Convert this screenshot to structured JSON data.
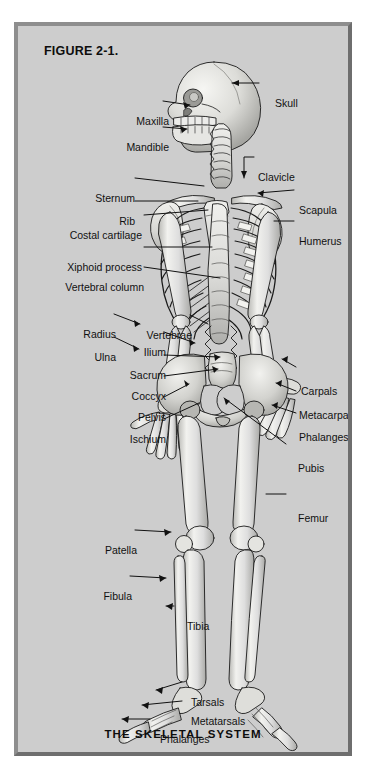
{
  "figure": {
    "number_label": "FIGURE 2-1.",
    "caption": "THE SKELETAL SYSTEM",
    "frame_color": "#7e7e7e",
    "background_color": "#cdcdcd",
    "page_background": "#ffffff",
    "bone_fill_color": "#e8e8e6",
    "outline_color": "#1a1a1a",
    "leader_line_color": "#111111"
  },
  "labels": {
    "left": [
      {
        "text": "Maxilla",
        "x": 151,
        "y": 96,
        "target_x": 186,
        "target_y": 100
      },
      {
        "text": "Mandible",
        "x": 151,
        "y": 122,
        "target_x": 183,
        "target_y": 124
      },
      {
        "text": "Sternum",
        "x": 114,
        "y": 173,
        "target_x": 193,
        "target_y": 180
      },
      {
        "text": "Rib",
        "x": 114,
        "y": 196,
        "target_x": 186,
        "target_y": 196
      },
      {
        "text": "Costal cartilage",
        "x": 137,
        "y": 216,
        "target_x": 196,
        "target_y": 210
      },
      {
        "text": "Xiphoid process",
        "x": 137,
        "y": 242,
        "target_x": 199,
        "target_y": 242
      },
      {
        "text": "Vertebral column",
        "x": 137,
        "y": 262,
        "target_x": 207,
        "target_y": 272
      },
      {
        "text": "Radius",
        "x": 104,
        "y": 309,
        "target_x": 127,
        "target_y": 318
      },
      {
        "text": "Ulna",
        "x": 104,
        "y": 332,
        "target_x": 126,
        "target_y": 343
      },
      {
        "text": "Vertebrae",
        "x": 181,
        "y": 310,
        "target_x": 196,
        "target_y": 318
      },
      {
        "text": "Ilium",
        "x": 155,
        "y": 327,
        "target_x": 182,
        "target_y": 337
      },
      {
        "text": "Sacrum",
        "x": 155,
        "y": 350,
        "target_x": 207,
        "target_y": 351
      },
      {
        "text": "Coccyx",
        "x": 155,
        "y": 371,
        "target_x": 205,
        "target_y": 363
      },
      {
        "text": "Pelvis",
        "x": 155,
        "y": 392,
        "target_x": 176,
        "target_y": 378
      },
      {
        "text": "Ischium",
        "x": 155,
        "y": 414,
        "target_x": 186,
        "target_y": 397
      },
      {
        "text": "Patella",
        "x": 123,
        "y": 525,
        "target_x": 158,
        "target_y": 527
      },
      {
        "text": "Fibula",
        "x": 118,
        "y": 571,
        "target_x": 152,
        "target_y": 572
      },
      {
        "text": "Tibia",
        "x": 167,
        "y": 601,
        "target_x": 153,
        "target_y": 600
      }
    ],
    "right": [
      {
        "text": "Skull",
        "x": 255,
        "y": 78,
        "target_x": 228,
        "target_y": 79
      },
      {
        "text": "Clavicle",
        "x": 238,
        "y": 152,
        "target_x": 232,
        "target_y": 173
      },
      {
        "text": "Scapula",
        "x": 290,
        "y": 185,
        "target_x": 243,
        "target_y": 187
      },
      {
        "text": "Humerus",
        "x": 290,
        "y": 216,
        "target_x": 258,
        "target_y": 216
      },
      {
        "text": "Carpals",
        "x": 286,
        "y": 366,
        "target_x": 268,
        "target_y": 357
      },
      {
        "text": "Metacarpals",
        "x": 286,
        "y": 390,
        "target_x": 262,
        "target_y": 381
      },
      {
        "text": "Phalanges",
        "x": 286,
        "y": 412,
        "target_x": 258,
        "target_y": 403
      },
      {
        "text": "Pubis",
        "x": 278,
        "y": 443,
        "target_x": 211,
        "target_y": 395
      },
      {
        "text": "Femur",
        "x": 278,
        "y": 493,
        "target_x": 252,
        "target_y": 493
      },
      {
        "text": "Tarsals",
        "x": 171,
        "y": 677,
        "target_x": 142,
        "target_y": 686
      },
      {
        "text": "Metatarsals",
        "x": 171,
        "y": 696,
        "target_x": 128,
        "target_y": 700
      },
      {
        "text": "Phalanges",
        "x": 140,
        "y": 714,
        "target_x": 108,
        "target_y": 714
      }
    ]
  },
  "bone_groups": [
    "skull",
    "maxilla",
    "mandible",
    "cervical-vertebrae",
    "clavicle",
    "scapula",
    "sternum",
    "ribs",
    "costal-cartilage",
    "xiphoid-process",
    "vertebral-column",
    "humerus",
    "radius",
    "ulna",
    "carpals",
    "metacarpals",
    "hand-phalanges",
    "ilium",
    "sacrum",
    "coccyx",
    "pelvis",
    "ischium",
    "pubis",
    "femur",
    "patella",
    "tibia",
    "fibula",
    "tarsals",
    "metatarsals",
    "foot-phalanges"
  ]
}
